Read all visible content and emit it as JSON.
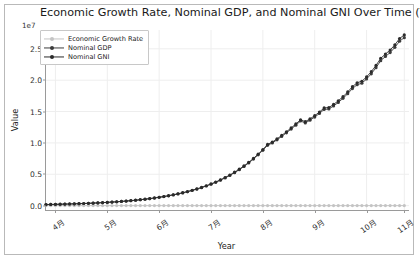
{
  "chart_data": {
    "type": "line",
    "title": "Economic Growth Rate, Nominal GDP, and Nominal GNI Over Time (Yearly)",
    "xlabel": "Year",
    "ylabel": "Value",
    "y_offset_text": "1e7",
    "y_offset_multiplier": 10000000,
    "ylim": [
      -700000,
      28000000
    ],
    "yticks": [
      0,
      5000000,
      10000000,
      15000000,
      20000000,
      25000000
    ],
    "ytick_labels": [
      "0.0",
      "0.5",
      "1.0",
      "1.5",
      "2.0",
      "2.5"
    ],
    "xlim": [
      0,
      77
    ],
    "xticks": [
      2,
      13,
      24,
      35,
      46,
      57,
      68,
      76
    ],
    "xtick_labels": [
      "4月",
      "5月",
      "6月",
      "7月",
      "8月",
      "9月",
      "10月",
      "11月"
    ],
    "xtick_rotation": -35,
    "grid": true,
    "grid_color": "#eeeeee",
    "legend_position": "upper left",
    "marker": "o",
    "series": [
      {
        "name": "Economic Growth Rate",
        "color": "#c4c4c4",
        "values": [
          3.1,
          2.8,
          3.4,
          2.9,
          3.6,
          3.0,
          2.7,
          3.3,
          2.5,
          3.8,
          2.6,
          3.1,
          2.9,
          3.5,
          2.4,
          3.2,
          2.8,
          3.6,
          2.7,
          3.0,
          3.4,
          2.5,
          3.1,
          2.9,
          3.7,
          2.6,
          3.3,
          2.8,
          3.5,
          2.4,
          3.0,
          3.2,
          2.7,
          3.6,
          2.9,
          3.1,
          2.5,
          3.4,
          2.8,
          3.3,
          2.6,
          3.0,
          3.5,
          2.7,
          3.2,
          2.9,
          3.6,
          2.4,
          3.1,
          2.8,
          3.4,
          2.6,
          3.0,
          3.3,
          2.5,
          3.7,
          2.9,
          3.1,
          2.7,
          3.5,
          2.8,
          3.2,
          2.6,
          3.4,
          3.0,
          2.9,
          3.6,
          2.5,
          3.1,
          2.7,
          3.3,
          2.8,
          3.5,
          2.6,
          3.0,
          3.2,
          2.9
        ]
      },
      {
        "name": "Nominal GDP",
        "color": "#3c3c3c",
        "values": [
          168000,
          183000,
          201000,
          219000,
          238000,
          259000,
          282000,
          307000,
          334000,
          363000,
          396000,
          431000,
          470000,
          512000,
          558000,
          608000,
          662000,
          721000,
          786000,
          856000,
          933000,
          1017000,
          1108000,
          1208000,
          1317000,
          1436000,
          1566000,
          1707000,
          1861000,
          2029000,
          2212000,
          2412000,
          2630000,
          2867000,
          3126000,
          3408000,
          3716000,
          4051000,
          4417000,
          4816000,
          5251000,
          5725000,
          6242000,
          6806000,
          7421000,
          8091000,
          8821000,
          9617000,
          9980000,
          10490000,
          11030000,
          11600000,
          12200000,
          12830000,
          13490000,
          13180000,
          13620000,
          14120000,
          14690000,
          15330000,
          15400000,
          15880000,
          16450000,
          17100000,
          17840000,
          18660000,
          19280000,
          19510000,
          20190000,
          21020000,
          21990000,
          23100000,
          23780000,
          24400000,
          25230000,
          26210000,
          26780000
        ]
      },
      {
        "name": "Nominal GNI",
        "color": "#2b2b2b",
        "values": [
          170000,
          185000,
          203000,
          222000,
          241000,
          262000,
          286000,
          311000,
          338000,
          368000,
          401000,
          437000,
          476000,
          519000,
          566000,
          616000,
          671000,
          731000,
          797000,
          868000,
          946000,
          1031000,
          1123000,
          1225000,
          1335000,
          1456000,
          1588000,
          1731000,
          1887000,
          2057000,
          2243000,
          2446000,
          2667000,
          2907000,
          3170000,
          3456000,
          3768000,
          4108000,
          4479000,
          4884000,
          5325000,
          5806000,
          6330000,
          6902000,
          7526000,
          8206000,
          8946000,
          9754000,
          10120000,
          10640000,
          11190000,
          11770000,
          12380000,
          13020000,
          13690000,
          13380000,
          13830000,
          14340000,
          14920000,
          15570000,
          15640000,
          16130000,
          16710000,
          17370000,
          18120000,
          18960000,
          19590000,
          19830000,
          20520000,
          21360000,
          22350000,
          23480000,
          24170000,
          24800000,
          25640000,
          26640000,
          27210000
        ]
      }
    ]
  }
}
